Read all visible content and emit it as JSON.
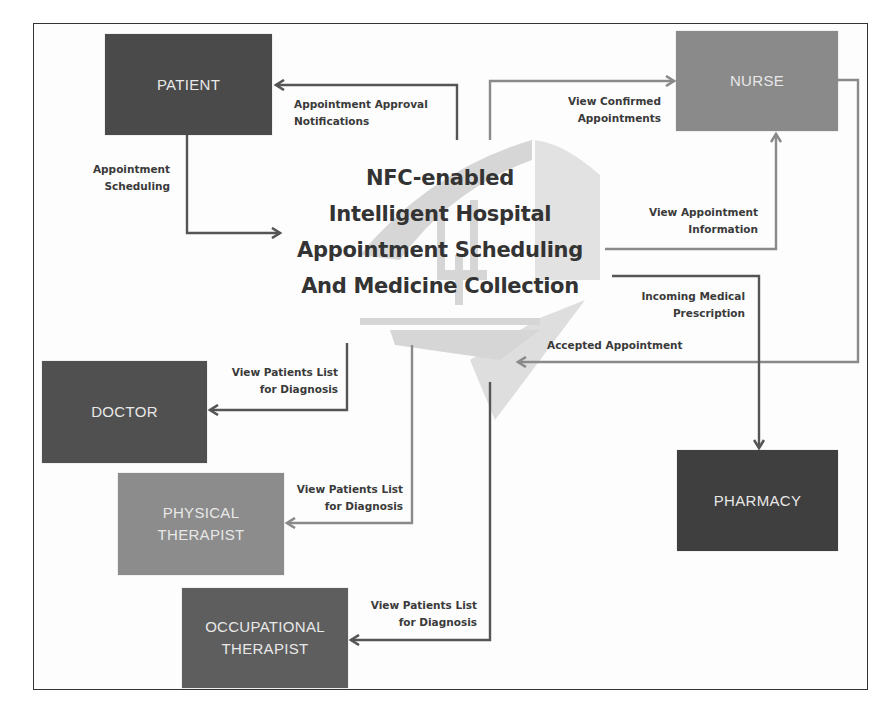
{
  "diagram": {
    "title_lines": [
      "NFC-enabled",
      "Intelligent Hospital",
      "Appointment Scheduling",
      "And Medicine Collection"
    ],
    "background_logo": "hospital-building-logo (faded watermark)",
    "colors": {
      "frame": "#333333",
      "patient_box": "#4a4a4a",
      "nurse_box": "#8a8a8a",
      "doctor_box": "#505050",
      "physical_therapist_box": "#8c8c8c",
      "occupational_therapist_box": "#5e5e5e",
      "pharmacy_box": "#3f3f3f",
      "dark_arrow": "#555555",
      "light_arrow": "#8a8a8a",
      "logo": "#cfcfcf"
    },
    "nodes": {
      "patient": {
        "lines": [
          "PATIENT"
        ]
      },
      "nurse": {
        "lines": [
          "NURSE"
        ]
      },
      "doctor": {
        "lines": [
          "DOCTOR"
        ]
      },
      "physical_therapist": {
        "lines": [
          "PHYSICAL",
          "THERAPIST"
        ]
      },
      "occupational_therapist": {
        "lines": [
          "OCCUPATIONAL",
          "THERAPIST"
        ]
      },
      "pharmacy": {
        "lines": [
          "PHARMACY"
        ]
      }
    },
    "edges": {
      "approval": {
        "from": "system",
        "to": "patient",
        "lines": [
          "Appointment Approval",
          "Notifications"
        ]
      },
      "scheduling": {
        "from": "patient",
        "to": "system",
        "lines": [
          "Appointment",
          "Scheduling"
        ]
      },
      "confirmed": {
        "from": "system",
        "to": "nurse",
        "lines": [
          "View Confirmed",
          "Appointments"
        ]
      },
      "info": {
        "from": "system",
        "to": "nurse",
        "lines": [
          "View Appointment",
          "Information"
        ]
      },
      "prescription": {
        "from": "system",
        "to": "pharmacy",
        "lines": [
          "Incoming Medical",
          "Prescription"
        ]
      },
      "accepted": {
        "from": "nurse",
        "to": "system",
        "lines": [
          "Accepted Appointment"
        ]
      },
      "doctor_list": {
        "from": "system",
        "to": "doctor",
        "lines": [
          "View Patients List",
          "for Diagnosis"
        ]
      },
      "pt_list": {
        "from": "system",
        "to": "physical_therapist",
        "lines": [
          "View Patients List",
          "for Diagnosis"
        ]
      },
      "ot_list": {
        "from": "system",
        "to": "occupational_therapist",
        "lines": [
          "View Patients List",
          "for Diagnosis"
        ]
      }
    }
  }
}
